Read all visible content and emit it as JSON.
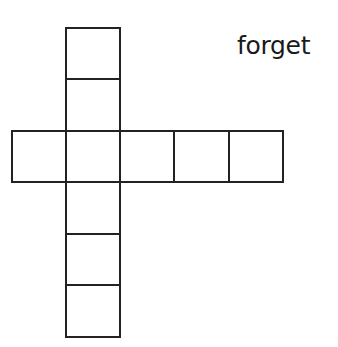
{
  "puzzle": {
    "clue_word": "forget",
    "type": "crossword-grid",
    "vertical_entry": {
      "cells": 7,
      "column_index": 1
    },
    "horizontal_entry": {
      "cells": 5,
      "row_index": 2
    },
    "cell_size_px": 54,
    "line_color": "#222222"
  }
}
